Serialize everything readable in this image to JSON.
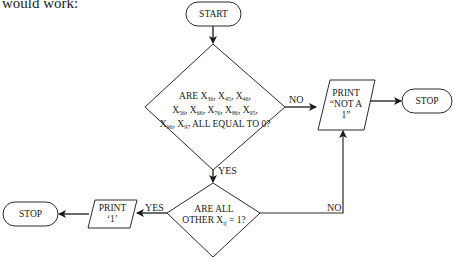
{
  "intro_text": "would work:",
  "nodes": {
    "start": {
      "type": "terminal",
      "label": "START"
    },
    "decision1": {
      "type": "decision",
      "line1": {
        "prefix": "ARE X",
        "items": [
          "36",
          "45",
          "46"
        ]
      },
      "line2": {
        "items": [
          "56",
          "66",
          "76",
          "86",
          "95"
        ]
      },
      "line3": {
        "items": [
          "96",
          "97"
        ],
        "suffix": " ALL EQUAL TO 0?"
      }
    },
    "print_not_one": {
      "type": "io",
      "line1": "PRINT",
      "line2": "“NOT A",
      "line3": "1”"
    },
    "stop_right": {
      "type": "terminal",
      "label": "STOP"
    },
    "decision2": {
      "type": "decision",
      "line1": "ARE ALL",
      "line2_prefix": "OTHER X",
      "line2_sub": "ij",
      "line2_suffix": " = 1?"
    },
    "print_one": {
      "type": "io",
      "line1": "PRINT",
      "line2": "‘1’"
    },
    "stop_left": {
      "type": "terminal",
      "label": "STOP"
    }
  },
  "edges": {
    "d1_no": "NO",
    "d1_yes": "YES",
    "d2_yes": "YES",
    "d2_no": "NO"
  },
  "colors": {
    "stroke": "#2a2a2a",
    "background": "#ffffff"
  }
}
